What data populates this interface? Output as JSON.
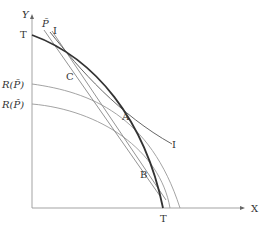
{
  "diagram": {
    "type": "economics-ppf-diagram",
    "axes": {
      "x_label": "X",
      "y_label": "Y"
    },
    "curves": {
      "transformation_curve": {
        "label_top": "T",
        "label_bottom": "T"
      },
      "revenue_curve_upper": {
        "label": "R(P̄)"
      },
      "revenue_curve_lower": {
        "label": "R(P̂)"
      },
      "indifference_curve": {
        "label_top": "I",
        "label_right": "I"
      },
      "price_line": {
        "label": "P̄"
      }
    },
    "points": {
      "C": "C",
      "A": "A",
      "B": "B"
    },
    "colors": {
      "axis": "#888888",
      "heavy_curve": "#333333",
      "thin_curve": "#999999",
      "text": "#333333"
    }
  }
}
